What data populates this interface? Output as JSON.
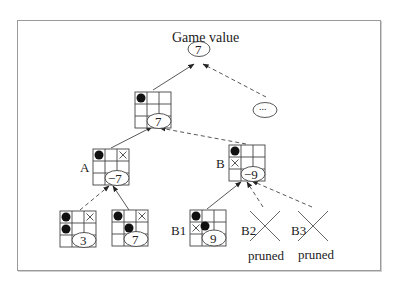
{
  "diagram": {
    "type": "game-tree-alpha-beta-pruning",
    "root": {
      "title": "Game value",
      "value": "7"
    },
    "ellipsis_node": {
      "label": "..."
    },
    "level1": {
      "value": "7",
      "board": [
        "O",
        "",
        "",
        "",
        "",
        "",
        "",
        "",
        ""
      ]
    },
    "nodes": {
      "A": {
        "label": "A",
        "value": "−7",
        "board": [
          "O",
          "",
          "X",
          "",
          "",
          "",
          "",
          "",
          ""
        ]
      },
      "B": {
        "label": "B",
        "value": "−9",
        "board": [
          "O",
          "",
          "",
          "X",
          "",
          "",
          "",
          "",
          ""
        ]
      },
      "A_child1": {
        "value": "3",
        "board": [
          "O",
          "",
          "X",
          "O",
          "",
          "",
          "",
          "",
          ""
        ]
      },
      "A_child2": {
        "value": "7",
        "board": [
          "O",
          "",
          "X",
          "",
          "O",
          "",
          "",
          "",
          ""
        ]
      },
      "B1": {
        "label": "B1",
        "value": "9",
        "board": [
          "O",
          "",
          "",
          "X",
          "O",
          "",
          "",
          "",
          ""
        ]
      },
      "B2": {
        "label": "B2",
        "status": "pruned"
      },
      "B3": {
        "label": "B3",
        "status": "pruned"
      }
    },
    "edges": [
      {
        "from": "level1",
        "to": "root",
        "style": "solid"
      },
      {
        "from": "ellipsis_node",
        "to": "root",
        "style": "dashed"
      },
      {
        "from": "A",
        "to": "level1",
        "style": "solid"
      },
      {
        "from": "B",
        "to": "level1",
        "style": "dashed"
      },
      {
        "from": "A_child1",
        "to": "A",
        "style": "dashed"
      },
      {
        "from": "A_child2",
        "to": "A",
        "style": "solid"
      },
      {
        "from": "B1",
        "to": "B",
        "style": "solid"
      },
      {
        "from": "B2",
        "to": "B",
        "style": "dashed"
      },
      {
        "from": "B3",
        "to": "B",
        "style": "dashed"
      }
    ],
    "colors": {
      "line": "#333333",
      "frame": "#9a9a9a",
      "stone": "#111111"
    }
  }
}
